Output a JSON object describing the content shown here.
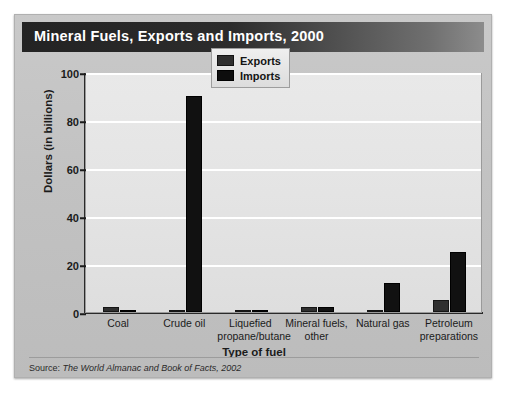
{
  "title": "Mineral Fuels, Exports and Imports, 2000",
  "source": {
    "prefix": "Source:",
    "citation": "The World Almanac and Book of Facts, 2002"
  },
  "legend": {
    "position": "top-center-right",
    "entries": [
      "Exports",
      "Imports"
    ]
  },
  "colors": {
    "exports": "#2f2f2f",
    "imports": "#111111",
    "plot_background": "#e6e6e6",
    "card_background": "#c4c4c4",
    "title_bar": "#232323",
    "gridline": "#ffffff"
  },
  "chart_data": {
    "type": "bar",
    "title": "Mineral Fuels, Exports and Imports, 2000",
    "xlabel": "Type of fuel",
    "ylabel": "Dollars (in billions)",
    "ylim": [
      0,
      100
    ],
    "yticks": [
      0,
      20,
      40,
      60,
      80,
      100
    ],
    "grid": true,
    "categories": [
      "Coal",
      "Crude oil",
      "Liquefied propane/butane",
      "Mineral fuels, other",
      "Natural gas",
      "Petroleum preparations"
    ],
    "category_lines": [
      [
        "Coal",
        ""
      ],
      [
        "Crude oil",
        ""
      ],
      [
        "Liquefied",
        "propane/butane"
      ],
      [
        "Mineral fuels,",
        "other"
      ],
      [
        "Natural gas",
        ""
      ],
      [
        "Petroleum",
        "preparations"
      ]
    ],
    "series": [
      {
        "name": "Exports",
        "values": [
          2,
          0.5,
          0.3,
          2,
          0.5,
          5
        ]
      },
      {
        "name": "Imports",
        "values": [
          0.5,
          90,
          1,
          2,
          12,
          25
        ]
      }
    ]
  }
}
